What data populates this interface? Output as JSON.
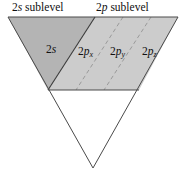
{
  "figure": {
    "headers": [
      {
        "id": "2s-sublevel",
        "prefix": "2",
        "italic": "s",
        "suffix": " sublevel"
      },
      {
        "id": "2p-sublevel",
        "prefix": "2",
        "italic": "p",
        "suffix": " sublevel"
      }
    ],
    "orbitals": [
      {
        "id": "2s",
        "prefix": "2",
        "italic": "s",
        "subscript": ""
      },
      {
        "id": "2px",
        "prefix": "2",
        "italic": "p",
        "subscript": "x"
      },
      {
        "id": "2py",
        "prefix": "2",
        "italic": "p",
        "subscript": "y"
      },
      {
        "id": "2pz",
        "prefix": "2",
        "italic": "p",
        "subscript": "z"
      }
    ],
    "colors": {
      "s_region_fill": "#b4b4b4",
      "p_region_fill": "#cccccc",
      "empty_fill": "#ffffff",
      "outline": "#4a4a4a",
      "divider_solid": "#3a3a3a",
      "divider_dashed": "#9a9a9a",
      "text": "#111111",
      "background": "#ffffff"
    },
    "geometry": {
      "top_left": [
        8,
        17
      ],
      "top_right": [
        178,
        17
      ],
      "apex": [
        93,
        168
      ],
      "band_bottom_y": 90,
      "band_bottom_left": [
        48,
        90
      ],
      "band_bottom_right": [
        139,
        90
      ],
      "s_p_divider_top": [
        95,
        17
      ],
      "s_p_divider_bottom": [
        48,
        90
      ],
      "dashed_divider_1_top": [
        123,
        17
      ],
      "dashed_divider_1_bottom": [
        76,
        90
      ],
      "dashed_divider_2_top": [
        151,
        17
      ],
      "dashed_divider_2_bottom": [
        104,
        90
      ]
    }
  }
}
